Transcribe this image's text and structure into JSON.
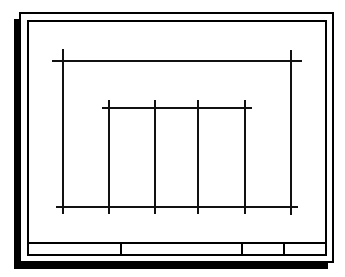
{
  "sheet": {
    "description": "Drawing sheet with structural grid layout",
    "colors": {
      "line": "#111111",
      "paper": "#ffffff",
      "shadow": "#000000"
    }
  },
  "grid": {
    "outer_horizontals": [
      {
        "y": 61,
        "x1": 52,
        "x2": 302
      },
      {
        "y": 207,
        "x1": 56,
        "x2": 298
      }
    ],
    "outer_verticals": [
      {
        "x": 63,
        "y1": 49,
        "y2": 214
      },
      {
        "x": 291,
        "y1": 50,
        "y2": 215
      }
    ],
    "inner_horizontal": {
      "y": 108,
      "x1": 102,
      "x2": 252
    },
    "inner_verticals": [
      {
        "x": 109,
        "y1": 100,
        "y2": 214
      },
      {
        "x": 155,
        "y1": 100,
        "y2": 214
      },
      {
        "x": 198,
        "y1": 100,
        "y2": 214
      },
      {
        "x": 245,
        "y1": 100,
        "y2": 214
      }
    ]
  },
  "title_block": {
    "cells": [
      "",
      "",
      "",
      ""
    ],
    "dividers_x": [
      119,
      241,
      283
    ]
  }
}
